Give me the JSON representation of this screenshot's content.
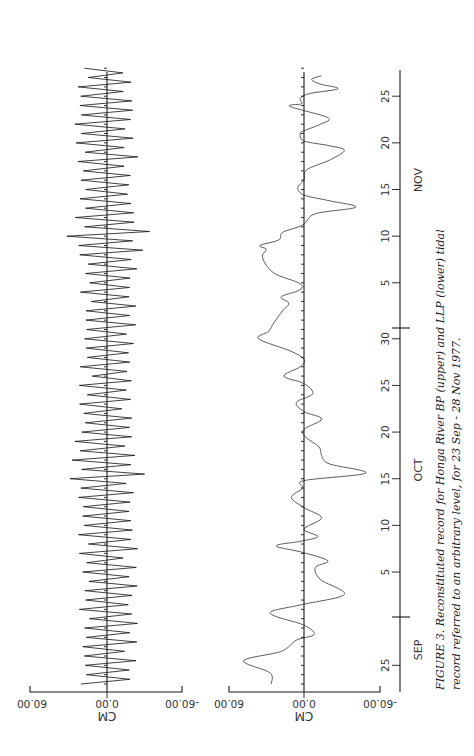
{
  "figure": {
    "caption_line1": "FIGURE 3.  Reconstituted record for Honga River BP (upper) and LLP (lower) tidal",
    "caption_line2": "record referred to an arbitrary level, for 23 Sep - 28 Nov 1977."
  },
  "panels": {
    "upper": {
      "unit_label": "CM",
      "tick_labels": [
        "60.00",
        "0.00",
        "-60.00"
      ]
    },
    "lower": {
      "unit_label": "CM",
      "tick_labels": [
        "60.00",
        "0.00",
        "-60.00"
      ]
    }
  },
  "time_axis": {
    "months": [
      "SEP",
      "OCT",
      "NOV"
    ],
    "day_ticks": [
      {
        "label": "25",
        "day": 2
      },
      {
        "label": "5",
        "day": 12
      },
      {
        "label": "10",
        "day": 17
      },
      {
        "label": "15",
        "day": 22
      },
      {
        "label": "20",
        "day": 27
      },
      {
        "label": "25",
        "day": 32
      },
      {
        "label": "30",
        "day": 37
      },
      {
        "label": "5",
        "day": 43
      },
      {
        "label": "10",
        "day": 48
      },
      {
        "label": "15",
        "day": 53
      },
      {
        "label": "20",
        "day": 58
      },
      {
        "label": "25",
        "day": 63
      }
    ]
  },
  "chart_data": [
    {
      "type": "line",
      "title": "Honga River BP (upper) — reconstituted tidal record",
      "xlabel": "Date (23 Sep - 28 Nov 1977)",
      "ylabel": "CM",
      "ylim": [
        -60,
        60
      ],
      "orientation": "rotated 90 degrees (time runs bottom to top)",
      "description": "Semidiurnal tidal oscillation; envelope half-amplitude by day",
      "x_days_from_sep23": [
        0,
        3,
        6,
        9,
        12,
        15,
        18,
        21,
        22,
        23,
        24,
        27,
        30,
        33,
        36,
        39,
        42,
        45,
        47,
        48,
        49,
        51,
        54,
        57,
        60,
        63,
        66
      ],
      "envelope_cm": [
        22,
        24,
        24,
        25,
        23,
        25,
        24,
        26,
        30,
        33,
        28,
        25,
        22,
        22,
        22,
        24,
        22,
        24,
        30,
        38,
        30,
        24,
        23,
        25,
        26,
        26,
        18
      ]
    },
    {
      "type": "line",
      "title": "LLP (lower) — reconstituted tidal record (low-passed)",
      "xlabel": "Date (23 Sep - 28 Nov 1977)",
      "ylabel": "CM",
      "ylim": [
        -60,
        60
      ],
      "orientation": "rotated 90 degrees (time runs bottom to top)",
      "x_days_from_sep23": [
        0,
        1.2,
        2.5,
        3.5,
        4.7,
        5.3,
        6.3,
        7.6,
        8.5,
        9.6,
        11.2,
        12.5,
        13.2,
        14.1,
        14.8,
        15.3,
        15.8,
        16.6,
        17.8,
        18.9,
        20.0,
        21.0,
        21.8,
        22.6,
        23.6,
        24.5,
        25.4,
        26.5,
        27.3,
        28.4,
        29.2,
        30.2,
        31.1,
        32.2,
        33.0,
        34.0,
        34.8,
        35.7,
        37.0,
        37.8,
        38.7,
        40.0,
        40.8,
        41.5,
        42.2,
        42.9,
        43.9,
        44.9,
        45.9,
        46.6,
        47.0,
        47.6,
        48.4,
        49.2,
        50.4,
        51.1,
        51.8,
        52.4,
        53.2,
        54.0,
        55.1,
        56.2,
        57.2,
        57.7,
        58.2,
        59.0,
        59.3,
        60.0,
        60.7,
        61.9,
        62.2,
        62.8,
        63.3,
        63.8,
        64.3,
        64.8,
        65.2
      ],
      "values_cm": [
        26,
        27,
        48,
        18,
        6,
        -8,
        0,
        27,
        2,
        -32,
        -13,
        -9,
        -19,
        1,
        22,
        3,
        -11,
        0,
        -14,
        0,
        10,
        1,
        0,
        -49,
        -20,
        -14,
        -12,
        -1,
        0,
        -14,
        0,
        6,
        -7,
        0,
        16,
        3,
        0,
        11,
        36,
        28,
        24,
        17,
        12,
        18,
        4,
        3,
        22,
        30,
        33,
        30,
        35,
        20,
        17,
        1,
        -9,
        -41,
        -20,
        0,
        5,
        0,
        -2,
        -21,
        -32,
        -20,
        0,
        3,
        0,
        -13,
        -19,
        11,
        2,
        3,
        -5,
        -27,
        -13,
        -6,
        -14
      ]
    }
  ]
}
